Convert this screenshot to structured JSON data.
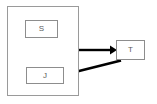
{
  "diagram": {
    "type": "block-diagram",
    "container": {
      "name": "outer-container",
      "label": "",
      "border_color": "#9a9a9a",
      "fill_color": "#ffffff"
    },
    "nodes": [
      {
        "id": "S",
        "label": "S",
        "inside_container": true,
        "border_color": "#8d8d8d",
        "fill_color": "#ffffff"
      },
      {
        "id": "J",
        "label": "J",
        "inside_container": true,
        "border_color": "#8d8d8d",
        "fill_color": "#ffffff"
      },
      {
        "id": "T",
        "label": "T",
        "inside_container": false,
        "border_color": "#8d8d8d",
        "fill_color": "#ffffff"
      }
    ],
    "arrows": [
      {
        "id": "container-to-t",
        "from": "outer-container",
        "to": "T",
        "direction": "right",
        "style": "straight",
        "color": "#000000",
        "label": ""
      },
      {
        "id": "t-to-j",
        "from": "T",
        "to": "J",
        "direction": "left-down",
        "style": "diagonal",
        "color": "#000000",
        "label": ""
      }
    ]
  }
}
